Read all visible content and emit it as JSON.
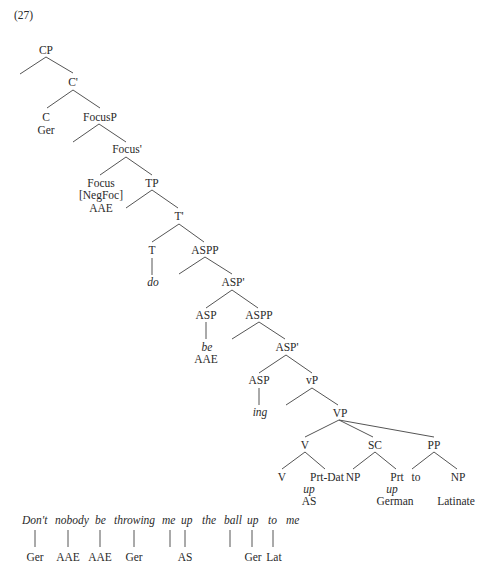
{
  "example_number": "(27)",
  "tree": {
    "CP": "CP",
    "C_bar": "C'",
    "C": "C",
    "C_lang": "Ger",
    "FocusP": "FocusP",
    "Focus_bar": "Focus'",
    "Focus": "Focus",
    "Focus_feature": "[NegFoc]",
    "Focus_lang": "AAE",
    "TP": "TP",
    "T_bar": "T'",
    "T": "T",
    "T_word": "do",
    "ASPP1": "ASPP",
    "ASP_bar1": "ASP'",
    "ASP1": "ASP",
    "ASP1_word": "be",
    "ASP1_lang": "AAE",
    "ASPP2": "ASPP",
    "ASP_bar2": "ASP'",
    "ASP2": "ASP",
    "ASP2_word": "ing",
    "vP": "vP",
    "VP": "VP",
    "V": "V",
    "V_inner": "V",
    "PrtDat": "Prt-Dat",
    "PrtDat_word": "up",
    "PrtDat_lang": "AS",
    "SC": "SC",
    "SC_NP": "NP",
    "SC_Prt": "Prt",
    "SC_Prt_word": "up",
    "SC_Prt_lang": "German",
    "PP": "PP",
    "PP_to": "to",
    "PP_NP": "NP",
    "PP_lang": "Latinate"
  },
  "sentence": {
    "words": [
      "Don't",
      "nobody",
      "be",
      "throwing",
      "me",
      "up",
      "the",
      "ball",
      "up",
      "to",
      "me"
    ],
    "glosses": [
      "Ger",
      "AAE",
      "AAE",
      "Ger",
      "AS",
      "Ger",
      "Lat"
    ]
  }
}
